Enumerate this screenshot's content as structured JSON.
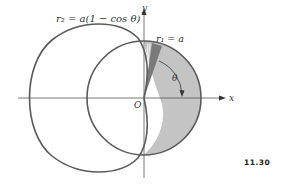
{
  "figure": {
    "number": "11.30",
    "curves": {
      "cardioid_label": "r₂ = a(1 − cos θ)",
      "circle_label": "r₁ = a"
    },
    "axes": {
      "x_label": "x",
      "y_label": "y",
      "origin_label": "O"
    },
    "angle_label": "θ",
    "colors": {
      "stroke": "#5a5a5a",
      "shaded": "#c4c4c4",
      "dark_wedge": "#7a7a7a",
      "axis": "#555555"
    }
  }
}
